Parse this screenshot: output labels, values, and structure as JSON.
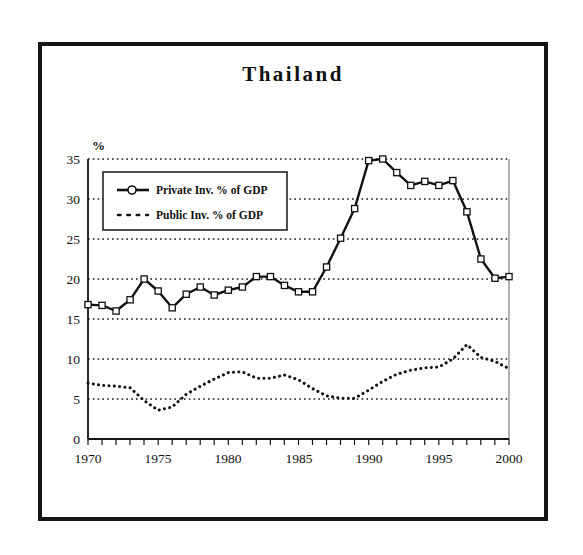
{
  "chart_data": {
    "type": "line",
    "title": "Thailand",
    "xlabel": "",
    "ylabel": "%",
    "ylim": [
      0,
      35
    ],
    "xlim": [
      1970,
      2000
    ],
    "yticks": [
      0,
      5,
      10,
      15,
      20,
      25,
      30,
      35
    ],
    "xticks": [
      1970,
      1975,
      1980,
      1985,
      1990,
      1995,
      2000
    ],
    "xtick_labels": [
      "1970",
      "1975",
      "1980",
      "1985",
      "1990",
      "1995",
      "2000"
    ],
    "ytick_labels": [
      "0",
      "5",
      "10",
      "15",
      "20",
      "25",
      "30",
      "35"
    ],
    "grid": true,
    "grid_style": "dotted-horizontal",
    "legend_position": "upper-left-inside",
    "x": [
      1970,
      1971,
      1972,
      1973,
      1974,
      1975,
      1976,
      1977,
      1978,
      1979,
      1980,
      1981,
      1982,
      1983,
      1984,
      1985,
      1986,
      1987,
      1988,
      1989,
      1990,
      1991,
      1992,
      1993,
      1994,
      1995,
      1996,
      1997,
      1998,
      1999,
      2000
    ],
    "series": [
      {
        "name": "Private Inv. % of GDP",
        "style": "solid",
        "marker": "open-square",
        "color": "#111111",
        "values": [
          16.8,
          16.7,
          16.0,
          17.4,
          20.0,
          18.5,
          16.4,
          18.1,
          19.0,
          18.0,
          18.6,
          19.0,
          20.3,
          20.3,
          19.2,
          18.4,
          18.4,
          21.5,
          25.1,
          28.8,
          34.8,
          35.0,
          33.3,
          31.7,
          32.2,
          31.7,
          32.3,
          28.4,
          22.5,
          20.1,
          20.3
        ]
      },
      {
        "name": "Public Inv. % of GDP",
        "style": "dotted",
        "marker": "none",
        "color": "#111111",
        "values": [
          7.0,
          6.7,
          6.6,
          6.4,
          4.8,
          3.6,
          4.0,
          5.6,
          6.6,
          7.5,
          8.3,
          8.4,
          7.6,
          7.6,
          8.0,
          7.4,
          6.3,
          5.4,
          5.1,
          5.1,
          6.1,
          7.2,
          8.1,
          8.6,
          8.9,
          9.0,
          10.0,
          11.8,
          10.2,
          9.7,
          8.8
        ]
      }
    ],
    "final_point_private": 18.6,
    "note_series_tail": "Private series final plotted value at 2000 is 18.6"
  },
  "legend": {
    "entries": [
      {
        "label": "Private Inv. % of GDP",
        "marker": "open-square-solid-line"
      },
      {
        "label": "Public Inv. % of GDP",
        "marker": "dotted-line"
      }
    ]
  },
  "axis": {
    "y_unit": "%"
  }
}
